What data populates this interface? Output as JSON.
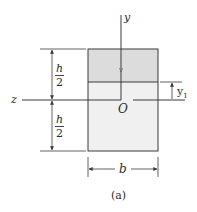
{
  "diagram": {
    "type": "rectangular cross-section with centroidal axes",
    "caption": "(a)",
    "axes": {
      "y_label": "y",
      "z_label": "z",
      "origin_label": "O"
    },
    "dimensions": {
      "height_upper": {
        "numerator": "h",
        "denominator": "2"
      },
      "height_lower": {
        "numerator": "h",
        "denominator": "2"
      },
      "width": "b",
      "offset": {
        "symbol": "y",
        "subscript": "1"
      }
    },
    "regions": [
      {
        "name": "upper-shaded-region",
        "fill": "#dcdcdc"
      },
      {
        "name": "lower-light-region",
        "fill": "#f0f0f0"
      }
    ],
    "colors": {
      "line": "#3a3a3a",
      "upper_fill": "#dcdcdc",
      "lower_fill": "#f0f0f0",
      "text": "#2a2a2a"
    }
  }
}
